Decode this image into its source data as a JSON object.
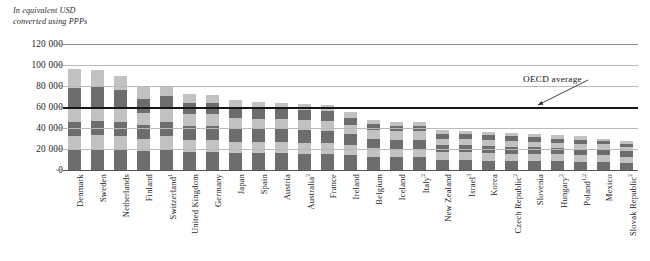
{
  "unit_caption": "In equivalent USD\nconverted using PPPs",
  "annotation": {
    "label": "OECD average",
    "x": 523,
    "y": 74,
    "arrow_from_x": 588,
    "arrow_from_y": 80,
    "arrow_to_x": 538,
    "arrow_to_y": 105
  },
  "colors": {
    "segment_dark": "#6d6d6d",
    "segment_light": "#c2c2c2",
    "average_line": "#161616",
    "gridline": "#b9b9b9",
    "axis_text": "#1c1c1c"
  },
  "chart_data": {
    "type": "bar",
    "subtype": "stacked-bar",
    "title": "",
    "subtitle": "",
    "xlabel": "",
    "ylabel": "In equivalent USD converted using PPPs",
    "ylim": [
      0,
      120000
    ],
    "ytick_values": [
      0,
      20000,
      40000,
      60000,
      80000,
      100000,
      120000
    ],
    "ytick_labels": [
      "0",
      "20 000",
      "40 000",
      "60 000",
      "80 000",
      "100 000",
      "120 000"
    ],
    "grid": true,
    "legend": false,
    "legend_position": "none",
    "annotations": [
      {
        "text": "OECD average",
        "value": 60000,
        "type": "horizontal-line"
      }
    ],
    "categories": [
      "Denmark",
      "Sweden",
      "Netherlands",
      "Finland",
      "Switzerland",
      "United Kingdom",
      "Germany",
      "Japan",
      "Spain",
      "Austria",
      "Australia",
      "France",
      "Ireland",
      "Belgium",
      "Iceland",
      "Italy",
      "New Zealand",
      "Israel",
      "Korea",
      "Czech Republic",
      "Slovenia",
      "Hungary",
      "Poland",
      "Mexico",
      "Slovak Republic"
    ],
    "category_labels": [
      "Denmark",
      "Sweden",
      "Netherlands",
      "Finland",
      "Switzerland¹",
      "United Kingdom",
      "Germany",
      "Japan",
      "Spain",
      "Austria",
      "Australia²",
      "France",
      "Ireland",
      "Belgium",
      "Iceland",
      "Italy²",
      "New Zealand",
      "Israel³",
      "Korea",
      "Czech Republic²",
      "Slovenia",
      "Hungary²",
      "Poland¹·²",
      "Mexico",
      "Slovak Republic²"
    ],
    "category_footnotes": [
      "",
      "",
      "",
      "",
      "1",
      "",
      "",
      "",
      "",
      "",
      "2",
      "",
      "",
      "",
      "",
      "2",
      "",
      "3",
      "",
      "2",
      "",
      "2",
      "1,2",
      "",
      "2"
    ],
    "values": [
      96000,
      95000,
      90000,
      79000,
      79000,
      72000,
      71000,
      67000,
      65000,
      64000,
      63000,
      62000,
      55000,
      48000,
      46000,
      46000,
      38000,
      37000,
      36000,
      35000,
      34000,
      33000,
      32000,
      30000,
      28000
    ],
    "stack_segments": [
      [
        20000,
        12000,
        14000,
        12000,
        20000,
        18000
      ],
      [
        20000,
        13000,
        14000,
        13000,
        20000,
        15000
      ],
      [
        19000,
        13000,
        14000,
        12000,
        18000,
        14000
      ],
      [
        18000,
        12000,
        13000,
        11000,
        14000,
        11000
      ],
      [
        19000,
        13000,
        14000,
        12000,
        13000,
        8000
      ],
      [
        17000,
        12000,
        13000,
        11000,
        11000,
        8000
      ],
      [
        17000,
        12000,
        13000,
        11000,
        11000,
        7000
      ],
      [
        16000,
        11000,
        12000,
        11000,
        10000,
        7000
      ],
      [
        16000,
        11000,
        12000,
        10000,
        10000,
        6000
      ],
      [
        16000,
        11000,
        12000,
        10000,
        9000,
        6000
      ],
      [
        15000,
        11000,
        12000,
        10000,
        9000,
        6000
      ],
      [
        15000,
        11000,
        11000,
        10000,
        9000,
        6000
      ],
      [
        14000,
        10000,
        10000,
        9000,
        7000,
        5000
      ],
      [
        12000,
        9000,
        9000,
        8000,
        6000,
        4000
      ],
      [
        12000,
        8000,
        9000,
        8000,
        5000,
        4000
      ],
      [
        12000,
        8000,
        9000,
        8000,
        5000,
        4000
      ],
      [
        10000,
        7000,
        7000,
        6000,
        4000,
        4000
      ],
      [
        10000,
        7000,
        7000,
        6000,
        4000,
        3000
      ],
      [
        9000,
        7000,
        7000,
        6000,
        4000,
        3000
      ],
      [
        9000,
        6000,
        7000,
        6000,
        4000,
        3000
      ],
      [
        9000,
        6000,
        7000,
        5000,
        4000,
        3000
      ],
      [
        9000,
        6000,
        6000,
        5000,
        4000,
        3000
      ],
      [
        8000,
        6000,
        6000,
        5000,
        4000,
        3000
      ],
      [
        8000,
        6000,
        6000,
        5000,
        3000,
        2000
      ],
      [
        7000,
        5000,
        6000,
        4000,
        3000,
        3000
      ]
    ],
    "segment_shading": [
      "dark",
      "light",
      "dark",
      "light",
      "dark",
      "light"
    ],
    "oecd_average": 60000
  }
}
